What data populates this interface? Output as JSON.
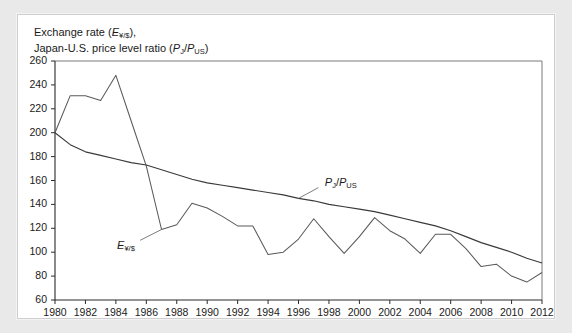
{
  "title": {
    "line1_pre": "Exchange rate (",
    "line1_sym": "E",
    "line1_sub": "¥/$",
    "line1_post": "),",
    "line2_pre": "Japan-U.S. price level ratio (",
    "line2_sym1": "P",
    "line2_sub1": "J",
    "line2_slash": "/",
    "line2_sym2": "P",
    "line2_sub2": "US",
    "line2_post": ")"
  },
  "annotations": {
    "exchange_rate": {
      "sym": "E",
      "sub": "¥/$"
    },
    "price_ratio": {
      "sym1": "P",
      "sub1": "J",
      "slash": "/",
      "sym2": "P",
      "sub2": "US"
    }
  },
  "colors": {
    "background": "#e9e9e9",
    "panel": "#ffffff",
    "axis": "#2b2b2b",
    "frame": "#6b6b6b",
    "series_price_ratio": "#3a3a3a",
    "series_exchange_rate": "#5a5a5a",
    "text": "#1a1a1a"
  },
  "chart_data": {
    "type": "line",
    "title": "Exchange rate (E¥/$), Japan-U.S. price level ratio (PJ/PUS)",
    "xlabel": "",
    "ylabel": "",
    "xlim": [
      1980,
      2012
    ],
    "ylim": [
      60,
      260
    ],
    "ytick_step": 20,
    "xtick_step": 2,
    "grid": false,
    "legend": "inline-annotations",
    "yticks": [
      60,
      80,
      100,
      120,
      140,
      160,
      180,
      200,
      220,
      240,
      260
    ],
    "xticks": [
      1980,
      1982,
      1984,
      1986,
      1988,
      1990,
      1992,
      1994,
      1996,
      1998,
      2000,
      2002,
      2004,
      2006,
      2008,
      2010,
      2012
    ],
    "x": [
      1980,
      1981,
      1982,
      1983,
      1984,
      1985,
      1986,
      1987,
      1988,
      1989,
      1990,
      1991,
      1992,
      1993,
      1994,
      1995,
      1996,
      1997,
      1998,
      1999,
      2000,
      2001,
      2002,
      2003,
      2004,
      2005,
      2006,
      2007,
      2008,
      2009,
      2010,
      2011,
      2012
    ],
    "series": [
      {
        "name": "E¥/$",
        "label_x": 1985.0,
        "label_y": 105,
        "values": [
          200,
          231,
          231,
          227,
          248,
          210,
          172,
          119,
          123,
          141,
          137,
          130,
          122,
          122,
          98,
          100,
          111,
          128,
          113,
          99,
          113,
          129,
          118,
          111,
          99,
          115,
          115,
          103,
          88,
          90,
          80,
          75,
          83
        ]
      },
      {
        "name": "PJ/PUS",
        "label_x": 1997.6,
        "label_y": 157,
        "values": [
          200,
          190,
          184,
          181,
          178,
          175,
          173,
          169,
          165,
          161,
          158,
          156,
          154,
          152,
          150,
          148,
          145,
          143,
          140,
          138,
          136,
          134,
          131,
          128,
          125,
          122,
          118,
          113,
          108,
          104,
          100,
          95,
          91
        ]
      }
    ]
  }
}
